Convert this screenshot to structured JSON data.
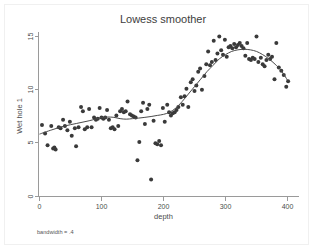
{
  "figure": {
    "title": "Lowess smoother",
    "note": "bandwidth = .4",
    "background_color": "#ffffff",
    "marker_color": "#3a3a3a",
    "line_color": "#4a4a4a",
    "axis_color": "#9a9a9a"
  },
  "chart_data": {
    "type": "scatter",
    "title": "Lowess smoother",
    "subtitle": "",
    "xlabel": "depth",
    "ylabel": "Wet hole 1",
    "annotation": "bandwidth = .4",
    "xlim": [
      -8,
      410
    ],
    "ylim": [
      0,
      16.2
    ],
    "xticks": [
      0,
      100,
      200,
      300,
      400
    ],
    "yticks": [
      0,
      5,
      10,
      15
    ],
    "xtick_labels": [
      "0",
      "100",
      "200",
      "300",
      "400"
    ],
    "ytick_labels": [
      "0",
      "5",
      "10",
      "15"
    ],
    "grid": false,
    "legend": "none",
    "series": [
      {
        "name": "Wet hole 1",
        "kind": "scatter",
        "marker": "filled-circle",
        "points": [
          [
            4,
            6.7
          ],
          [
            9,
            5.9
          ],
          [
            13,
            4.8
          ],
          [
            19,
            6.6
          ],
          [
            22,
            4.5
          ],
          [
            24,
            4.6
          ],
          [
            26,
            4.4
          ],
          [
            31,
            6.5
          ],
          [
            34,
            6.4
          ],
          [
            38,
            7.2
          ],
          [
            41,
            6.6
          ],
          [
            45,
            6.2
          ],
          [
            49,
            7.0
          ],
          [
            52,
            5.7
          ],
          [
            57,
            6.4
          ],
          [
            59,
            4.7
          ],
          [
            63,
            6.5
          ],
          [
            67,
            8.4
          ],
          [
            70,
            8.0
          ],
          [
            73,
            6.3
          ],
          [
            77,
            6.5
          ],
          [
            80,
            8.2
          ],
          [
            84,
            6.5
          ],
          [
            88,
            7.4
          ],
          [
            91,
            7.2
          ],
          [
            94,
            7.3
          ],
          [
            97,
            8.3
          ],
          [
            100,
            7.4
          ],
          [
            103,
            7.3
          ],
          [
            106,
            7.4
          ],
          [
            109,
            8.1
          ],
          [
            112,
            7.2
          ],
          [
            115,
            6.4
          ],
          [
            118,
            6.5
          ],
          [
            121,
            6.3
          ],
          [
            124,
            7.6
          ],
          [
            127,
            6.6
          ],
          [
            130,
            8.0
          ],
          [
            133,
            8.2
          ],
          [
            136,
            7.9
          ],
          [
            139,
            8.0
          ],
          [
            142,
            8.9
          ],
          [
            146,
            7.7
          ],
          [
            149,
            7.6
          ],
          [
            152,
            7.5
          ],
          [
            155,
            7.4
          ],
          [
            158,
            3.4
          ],
          [
            161,
            5.1
          ],
          [
            164,
            8.0
          ],
          [
            167,
            8.8
          ],
          [
            170,
            6.8
          ],
          [
            174,
            8.2
          ],
          [
            177,
            8.6
          ],
          [
            180,
            1.6
          ],
          [
            184,
            7.1
          ],
          [
            187,
            5.0
          ],
          [
            190,
            4.9
          ],
          [
            193,
            5.2
          ],
          [
            196,
            4.8
          ],
          [
            199,
            8.3
          ],
          [
            202,
            7.0
          ],
          [
            206,
            8.6
          ],
          [
            209,
            7.9
          ],
          [
            212,
            7.6
          ],
          [
            215,
            7.8
          ],
          [
            218,
            7.9
          ],
          [
            221,
            8.1
          ],
          [
            224,
            8.4
          ],
          [
            228,
            9.3
          ],
          [
            231,
            8.6
          ],
          [
            234,
            9.4
          ],
          [
            237,
            10.1
          ],
          [
            240,
            8.4
          ],
          [
            244,
            10.7
          ],
          [
            247,
            11.0
          ],
          [
            250,
            9.9
          ],
          [
            253,
            10.4
          ],
          [
            256,
            11.7
          ],
          [
            259,
            12.0
          ],
          [
            262,
            10.0
          ],
          [
            266,
            11.3
          ],
          [
            269,
            12.4
          ],
          [
            272,
            13.6
          ],
          [
            275,
            12.3
          ],
          [
            278,
            12.6
          ],
          [
            281,
            14.6
          ],
          [
            284,
            12.8
          ],
          [
            287,
            13.4
          ],
          [
            290,
            15.0
          ],
          [
            293,
            13.7
          ],
          [
            296,
            13.3
          ],
          [
            299,
            14.7
          ],
          [
            302,
            13.1
          ],
          [
            305,
            14.0
          ],
          [
            308,
            14.1
          ],
          [
            311,
            13.9
          ],
          [
            314,
            14.3
          ],
          [
            317,
            14.0
          ],
          [
            320,
            14.2
          ],
          [
            323,
            14.4
          ],
          [
            326,
            14.1
          ],
          [
            329,
            13.9
          ],
          [
            332,
            13.2
          ],
          [
            335,
            14.4
          ],
          [
            338,
            12.9
          ],
          [
            341,
            12.8
          ],
          [
            344,
            13.0
          ],
          [
            347,
            12.9
          ],
          [
            350,
            15.0
          ],
          [
            353,
            12.6
          ],
          [
            357,
            13.0
          ],
          [
            360,
            12.4
          ],
          [
            363,
            12.2
          ],
          [
            366,
            12.8
          ],
          [
            369,
            13.3
          ],
          [
            372,
            12.9
          ],
          [
            375,
            13.1
          ],
          [
            379,
            11.0
          ],
          [
            382,
            14.4
          ],
          [
            386,
            12.1
          ],
          [
            390,
            11.8
          ],
          [
            394,
            11.4
          ],
          [
            398,
            10.3
          ],
          [
            401,
            10.8
          ]
        ]
      },
      {
        "name": "lowess smooth",
        "kind": "line",
        "points": [
          [
            0,
            5.85
          ],
          [
            20,
            6.25
          ],
          [
            40,
            6.6
          ],
          [
            60,
            6.85
          ],
          [
            80,
            7.1
          ],
          [
            100,
            7.4
          ],
          [
            110,
            7.45
          ],
          [
            120,
            7.42
          ],
          [
            130,
            7.3
          ],
          [
            140,
            7.25
          ],
          [
            150,
            7.3
          ],
          [
            160,
            7.35
          ],
          [
            170,
            7.42
          ],
          [
            180,
            7.5
          ],
          [
            190,
            7.6
          ],
          [
            200,
            7.7
          ],
          [
            210,
            7.9
          ],
          [
            220,
            8.3
          ],
          [
            230,
            8.9
          ],
          [
            240,
            9.6
          ],
          [
            250,
            10.3
          ],
          [
            260,
            11.0
          ],
          [
            270,
            11.7
          ],
          [
            280,
            12.3
          ],
          [
            290,
            12.9
          ],
          [
            300,
            13.3
          ],
          [
            310,
            13.6
          ],
          [
            320,
            13.75
          ],
          [
            330,
            13.8
          ],
          [
            340,
            13.75
          ],
          [
            350,
            13.6
          ],
          [
            360,
            13.3
          ],
          [
            370,
            12.9
          ],
          [
            380,
            12.4
          ],
          [
            390,
            11.8
          ],
          [
            400,
            10.9
          ]
        ]
      }
    ]
  }
}
